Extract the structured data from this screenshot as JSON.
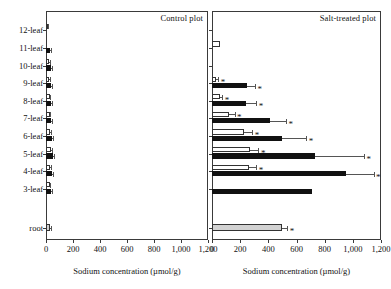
{
  "chart_data": {
    "type": "bar",
    "title": "",
    "xlabel": "Sodium concentration (µmol/g)",
    "ylabel": "",
    "xlim": [
      0,
      1200
    ],
    "xticks": [
      0,
      200,
      400,
      600,
      800,
      1000,
      1200
    ],
    "xticklabels": [
      "0",
      "200",
      "400",
      "600",
      "800",
      "1,000",
      "1,200"
    ],
    "grid": false,
    "orientation": "horizontal",
    "categories": [
      "12-leaf",
      "11-leaf",
      "10-leaf",
      "9-leaf",
      "8-leaf",
      "7-leaf",
      "6-leaf",
      "5-leaf",
      "4-leaf",
      "3-leaf",
      "root"
    ],
    "panels": [
      {
        "name": "control",
        "label": "Control plot",
        "series": [
          {
            "name": "leaf-sheath",
            "style": "open",
            "values": [
              12,
              null,
              22,
              24,
              26,
              26,
              30,
              34,
              30,
              26,
              null
            ],
            "errors": [
              4,
              null,
              6,
              6,
              6,
              6,
              7,
              8,
              7,
              6,
              null
            ],
            "significant": [
              false,
              false,
              false,
              false,
              false,
              false,
              false,
              false,
              false,
              false,
              false
            ]
          },
          {
            "name": "leaf-blade",
            "style": "filled",
            "values": [
              null,
              32,
              36,
              36,
              40,
              40,
              44,
              52,
              46,
              38,
              null
            ],
            "errors": [
              null,
              6,
              8,
              8,
              8,
              8,
              9,
              10,
              9,
              8,
              null
            ],
            "significant": [
              false,
              false,
              false,
              false,
              false,
              false,
              false,
              false,
              false,
              false,
              false
            ]
          },
          {
            "name": "root",
            "style": "gray",
            "values": [
              null,
              null,
              null,
              null,
              null,
              null,
              null,
              null,
              null,
              null,
              30
            ],
            "errors": [
              null,
              null,
              null,
              null,
              null,
              null,
              null,
              null,
              null,
              null,
              10
            ],
            "significant": [
              false,
              false,
              false,
              false,
              false,
              false,
              false,
              false,
              false,
              false,
              false
            ]
          }
        ]
      },
      {
        "name": "salt-treated",
        "label": "Salt-treated plot",
        "series": [
          {
            "name": "leaf-sheath",
            "style": "open",
            "values": [
              null,
              55,
              null,
              30,
              55,
              120,
              230,
              270,
              265,
              null,
              null
            ],
            "errors": [
              null,
              0,
              null,
              14,
              18,
              40,
              55,
              60,
              50,
              null,
              null
            ],
            "significant": [
              false,
              false,
              false,
              true,
              true,
              true,
              true,
              true,
              true,
              false,
              false
            ]
          },
          {
            "name": "leaf-blade",
            "style": "filled",
            "values": [
              null,
              null,
              null,
              250,
              240,
              410,
              500,
              730,
              950,
              710,
              null
            ],
            "errors": [
              null,
              null,
              null,
              55,
              75,
              115,
              170,
              350,
              200,
              0,
              null
            ],
            "significant": [
              false,
              false,
              false,
              true,
              true,
              true,
              true,
              true,
              true,
              false,
              false
            ]
          },
          {
            "name": "root",
            "style": "gray",
            "values": [
              null,
              null,
              null,
              null,
              null,
              null,
              null,
              null,
              null,
              null,
              495
            ],
            "errors": [
              null,
              null,
              null,
              null,
              null,
              null,
              null,
              null,
              null,
              null,
              40
            ],
            "significant": [
              false,
              false,
              false,
              false,
              false,
              false,
              false,
              false,
              false,
              false,
              true
            ]
          }
        ]
      }
    ],
    "annotations": {
      "significance_marker": "*"
    }
  },
  "axis": {
    "xlabel": "Sodium concentration (µmol/g)",
    "xticklabels": [
      "0",
      "200",
      "400",
      "600",
      "800",
      "1,000",
      "1,200"
    ]
  },
  "panel_titles": {
    "control": "Control plot",
    "salt": "Salt-treated plot"
  },
  "category_labels": [
    "12-leaf",
    "11-leaf",
    "10-leaf",
    "9-leaf",
    "8-leaf",
    "7-leaf",
    "6-leaf",
    "5-leaf",
    "4-leaf",
    "3-leaf",
    "root"
  ]
}
